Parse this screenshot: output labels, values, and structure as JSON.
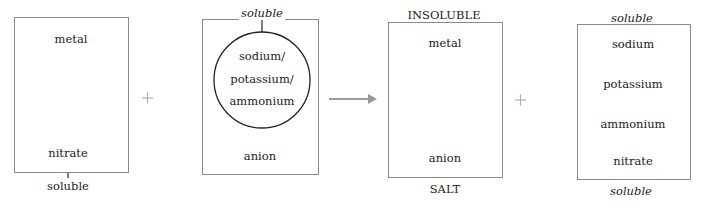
{
  "diagram": {
    "reactant_1": {
      "top_label": "metal",
      "ellipse_label": "nitrate",
      "below_label": "soluble"
    },
    "operator_1": "+",
    "reactant_2": {
      "above_label": "soluble",
      "circle_lines": [
        "sodium/",
        "potassium/",
        "ammonium"
      ],
      "bottom_label": "anion"
    },
    "arrow": "→",
    "product_1": {
      "above_label": "INSOLUBLE",
      "top_label": "metal",
      "bottom_label": "anion",
      "below_label": "SALT"
    },
    "operator_2": "+",
    "product_2": {
      "above_label": "soluble",
      "items": [
        "sodium",
        "potassium",
        "ammonium",
        "nitrate"
      ],
      "below_label": "soluble"
    },
    "colors": {
      "box_border": "#8a8a8a",
      "shape_stroke": "#222222",
      "arrow": "#9a9a9a",
      "plus": "#b0b0b0"
    }
  }
}
